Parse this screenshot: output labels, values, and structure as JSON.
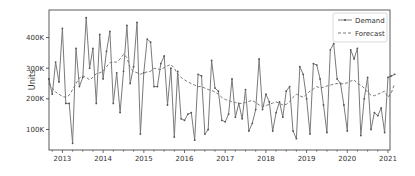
{
  "chart_data": {
    "type": "line",
    "title": "",
    "xlabel": "",
    "ylabel": "Units",
    "x_start": "2012-09",
    "x_frequency": "monthly",
    "xlim": [
      2012.67,
      2021.05
    ],
    "ylim": [
      33000,
      490000
    ],
    "x_ticks": [
      2013,
      2014,
      2015,
      2016,
      2017,
      2018,
      2019,
      2020,
      2021
    ],
    "x_tick_labels": [
      "2013",
      "2014",
      "2015",
      "2016",
      "2017",
      "2018",
      "2019",
      "2020",
      "2021"
    ],
    "y_ticks": [
      100000,
      200000,
      300000,
      400000
    ],
    "y_tick_labels": [
      "100K",
      "200K",
      "300K",
      "400K"
    ],
    "grid": false,
    "legend_position": "upper right",
    "legend": [
      "Demand",
      "Forecast"
    ],
    "series": [
      {
        "name": "Demand",
        "style": "solid-with-markers",
        "color": "#7a7a7a",
        "values": [
          265000,
          215000,
          320000,
          255000,
          430000,
          185000,
          185000,
          55000,
          365000,
          240000,
          270000,
          465000,
          300000,
          365000,
          185000,
          410000,
          265000,
          355000,
          420000,
          185000,
          285000,
          155000,
          290000,
          440000,
          250000,
          305000,
          450000,
          85000,
          285000,
          395000,
          385000,
          240000,
          240000,
          315000,
          340000,
          180000,
          300000,
          75000,
          290000,
          135000,
          130000,
          150000,
          155000,
          65000,
          280000,
          275000,
          85000,
          100000,
          325000,
          235000,
          225000,
          130000,
          125000,
          150000,
          265000,
          140000,
          185000,
          135000,
          230000,
          95000,
          120000,
          165000,
          330000,
          165000,
          215000,
          190000,
          95000,
          155000,
          190000,
          140000,
          225000,
          240000,
          95000,
          70000,
          305000,
          280000,
          200000,
          85000,
          315000,
          310000,
          265000,
          180000,
          90000,
          360000,
          380000,
          265000,
          250000,
          180000,
          95000,
          360000,
          330000,
          365000,
          80000,
          200000,
          270000,
          100000,
          155000,
          145000,
          170000,
          90000,
          270000,
          275000,
          280000
        ]
      },
      {
        "name": "Forecast",
        "style": "dashed",
        "color": "#7a7a7a",
        "values": [
          250000,
          235000,
          222000,
          215000,
          208000,
          205000,
          212000,
          230000,
          250000,
          268000,
          275000,
          270000,
          262000,
          270000,
          282000,
          285000,
          290000,
          305000,
          318000,
          320000,
          320000,
          330000,
          345000,
          335000,
          300000,
          290000,
          285000,
          280000,
          285000,
          288000,
          290000,
          300000,
          298000,
          295000,
          302000,
          308000,
          312000,
          300000,
          280000,
          270000,
          262000,
          255000,
          250000,
          245000,
          240000,
          240000,
          235000,
          230000,
          228000,
          222000,
          215000,
          205000,
          198000,
          195000,
          190000,
          188000,
          185000,
          185000,
          188000,
          192000,
          195000,
          188000,
          180000,
          175000,
          178000,
          182000,
          186000,
          190000,
          185000,
          180000,
          182000,
          190000,
          205000,
          215000,
          210000,
          205000,
          215000,
          225000,
          232000,
          240000,
          235000,
          238000,
          242000,
          245000,
          248000,
          250000,
          248000,
          250000,
          252000,
          258000,
          262000,
          250000,
          245000,
          235000,
          222000,
          212000,
          210000,
          215000,
          220000,
          225000,
          205000,
          220000,
          250000
        ]
      }
    ]
  }
}
